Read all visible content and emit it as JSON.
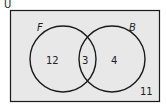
{
  "diagram": {
    "type": "venn",
    "universe_label": "U",
    "sets": [
      {
        "name": "F",
        "only_count": "12"
      },
      {
        "name": "B",
        "only_count": "4"
      }
    ],
    "intersection_count": "3",
    "outside_count": "11",
    "colors": {
      "background": "#e8e8e8",
      "stroke": "#1a1a1a",
      "text": "#222222"
    }
  }
}
